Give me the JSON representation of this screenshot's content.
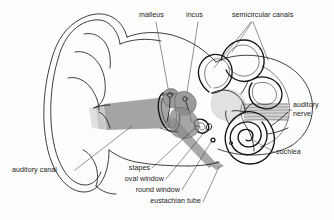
{
  "figure": {
    "type": "labeled-anatomical-diagram",
    "background_color": "#fdfdfd",
    "ink_color": "#1d1d1d",
    "shading_color": "#a0a0a0",
    "width": 334,
    "height": 220
  },
  "labels": {
    "malleus": "malleus",
    "incus": "incus",
    "semicircular_canals": "semicircular canals",
    "auditory_nerve_line1": "auditory",
    "auditory_nerve_line2": "nerve",
    "cochlea": "cochlea",
    "auditory_canal": "auditory canal",
    "stapes": "stapes",
    "oval_window": "oval window",
    "round_window": "round window",
    "eustachian_tube": "eustachian tube"
  },
  "structures": [
    {
      "name": "pinna",
      "label": null,
      "shaded": false
    },
    {
      "name": "auditory-canal",
      "label": "auditory canal",
      "shaded": true
    },
    {
      "name": "malleus",
      "label": "malleus",
      "shaded": true
    },
    {
      "name": "incus",
      "label": "incus",
      "shaded": true
    },
    {
      "name": "stapes",
      "label": "stapes",
      "shaded": true
    },
    {
      "name": "oval-window",
      "label": "oval window",
      "shaded": false
    },
    {
      "name": "round-window",
      "label": "round window",
      "shaded": false
    },
    {
      "name": "semicircular-canals",
      "label": "semicircular canals",
      "shaded": false
    },
    {
      "name": "cochlea",
      "label": "cochlea",
      "shaded": false
    },
    {
      "name": "auditory-nerve",
      "label": "auditory nerve",
      "shaded": true
    },
    {
      "name": "eustachian-tube",
      "label": "eustachian tube",
      "shaded": true
    }
  ]
}
